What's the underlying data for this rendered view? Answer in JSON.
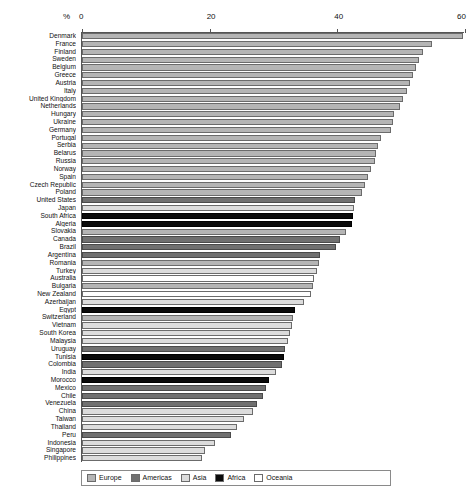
{
  "chart_data": {
    "type": "bar",
    "orientation": "horizontal",
    "title": "",
    "subtitle": "",
    "xlabel": "%",
    "ylabel": "",
    "xlim": [
      0,
      60
    ],
    "xticks": [
      0,
      20,
      40,
      60
    ],
    "grid": false,
    "legend_position": "bottom",
    "legend": [
      "Europe",
      "Americas",
      "Asia",
      "Africa",
      "Oceania"
    ],
    "group_colors": {
      "Europe": "#b5b5b5",
      "Americas": "#707070",
      "Asia": "#dcdcdc",
      "Africa": "#0a0a0a",
      "Oceania": "#ffffff"
    },
    "categories": [
      "Denmark",
      "France",
      "Finland",
      "Sweden",
      "Belgium",
      "Greece",
      "Austria",
      "Italy",
      "United Kingdom",
      "Netherlands",
      "Hungary",
      "Ukraine",
      "Germany",
      "Portugal",
      "Serbia",
      "Belarus",
      "Russia",
      "Norway",
      "Spain",
      "Czech Republic",
      "Poland",
      "United States",
      "Japan",
      "South Africa",
      "Algeria",
      "Slovakia",
      "Canada",
      "Brazil",
      "Argentina",
      "Romania",
      "Turkey",
      "Australia",
      "Bulgaria",
      "New Zealand",
      "Azerbaijan",
      "Egypt",
      "Switzerland",
      "Vietnam",
      "South Korea",
      "Malaysia",
      "Uruguay",
      "Tunisia",
      "Colombia",
      "India",
      "Morocco",
      "Mexico",
      "Chile",
      "Venezuela",
      "China",
      "Taiwan",
      "Thailand",
      "Peru",
      "Indonesia",
      "Singapore",
      "Philippines"
    ],
    "values": [
      59.8,
      55.0,
      53.5,
      53.0,
      52.5,
      52.0,
      51.5,
      51.0,
      50.5,
      50.0,
      49.0,
      48.8,
      48.5,
      47.0,
      46.5,
      46.2,
      46.0,
      45.5,
      45.0,
      44.5,
      44.0,
      43.0,
      42.8,
      42.6,
      42.5,
      41.5,
      40.5,
      40.0,
      37.5,
      37.3,
      37.0,
      36.5,
      36.3,
      36.0,
      35.0,
      33.5,
      33.2,
      33.0,
      32.8,
      32.5,
      32.0,
      31.8,
      31.5,
      30.5,
      29.5,
      29.0,
      28.5,
      27.5,
      27.0,
      25.5,
      24.5,
      23.5,
      21.0,
      19.5,
      19.0
    ],
    "groups": [
      "Europe",
      "Europe",
      "Europe",
      "Europe",
      "Europe",
      "Europe",
      "Europe",
      "Europe",
      "Europe",
      "Europe",
      "Europe",
      "Europe",
      "Europe",
      "Europe",
      "Europe",
      "Europe",
      "Europe",
      "Europe",
      "Europe",
      "Europe",
      "Europe",
      "Americas",
      "Asia",
      "Africa",
      "Africa",
      "Europe",
      "Americas",
      "Americas",
      "Americas",
      "Europe",
      "Asia",
      "Oceania",
      "Europe",
      "Oceania",
      "Asia",
      "Africa",
      "Europe",
      "Asia",
      "Asia",
      "Asia",
      "Americas",
      "Africa",
      "Americas",
      "Asia",
      "Africa",
      "Americas",
      "Americas",
      "Americas",
      "Asia",
      "Asia",
      "Asia",
      "Americas",
      "Asia",
      "Asia",
      "Asia"
    ]
  }
}
